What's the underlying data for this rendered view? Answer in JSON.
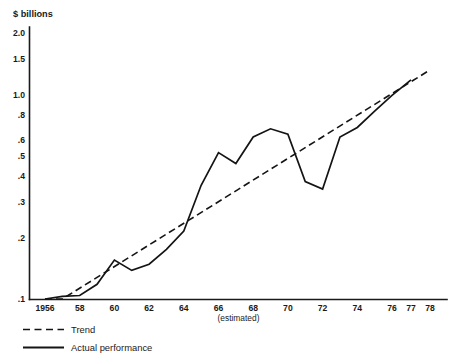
{
  "chart_data": {
    "type": "line",
    "title": "",
    "subtitle": "",
    "unit_label": "$ billions",
    "xlabel": "",
    "ylabel": "",
    "y_scale": "log",
    "ylim": [
      0.1,
      2.0
    ],
    "xlim": [
      1956,
      1978
    ],
    "grid": false,
    "legend_position": "bottom-left",
    "annotation": "(estimated)",
    "annotation_near_year": 1966,
    "y_ticks": [
      {
        "value": 2.0,
        "label": "2.0"
      },
      {
        "value": 1.5,
        "label": "1.5"
      },
      {
        "value": 1.0,
        "label": "1.0"
      },
      {
        "value": 0.8,
        "label": ".8"
      },
      {
        "value": 0.6,
        "label": ".6"
      },
      {
        "value": 0.5,
        "label": ".5"
      },
      {
        "value": 0.4,
        "label": ".4"
      },
      {
        "value": 0.3,
        "label": ".3"
      },
      {
        "value": 0.2,
        "label": ".2"
      },
      {
        "value": 0.1,
        "label": ".1"
      }
    ],
    "x_ticks": [
      {
        "value": 1956,
        "label": "1956"
      },
      {
        "value": 1958,
        "label": "58"
      },
      {
        "value": 1960,
        "label": "60"
      },
      {
        "value": 1962,
        "label": "62"
      },
      {
        "value": 1964,
        "label": "64"
      },
      {
        "value": 1966,
        "label": "66"
      },
      {
        "value": 1968,
        "label": "68"
      },
      {
        "value": 1970,
        "label": "70"
      },
      {
        "value": 1972,
        "label": "72"
      },
      {
        "value": 1974,
        "label": "74"
      },
      {
        "value": 1976,
        "label": "76"
      },
      {
        "value": 1977,
        "label": "77"
      },
      {
        "value": 1978,
        "label": "78"
      }
    ],
    "series": [
      {
        "name": "Actual performance",
        "style": "solid",
        "color": "#141414",
        "x": [
          1956,
          1957,
          1958,
          1959,
          1960,
          1961,
          1962,
          1963,
          1964,
          1965,
          1966,
          1967,
          1968,
          1969,
          1970,
          1971,
          1972,
          1973,
          1974,
          1975,
          1976,
          1977
        ],
        "y": [
          0.1,
          0.103,
          0.104,
          0.118,
          0.155,
          0.138,
          0.148,
          0.175,
          0.215,
          0.36,
          0.52,
          0.46,
          0.62,
          0.68,
          0.64,
          0.375,
          0.345,
          0.62,
          0.69,
          0.83,
          0.99,
          1.18
        ]
      },
      {
        "name": "Trend",
        "style": "dashed",
        "color": "#141414",
        "x": [
          1956,
          1957,
          1978
        ],
        "y": [
          0.1,
          0.1,
          1.32
        ]
      }
    ],
    "legend": [
      {
        "label": "Trend",
        "style": "dashed"
      },
      {
        "label": "Actual performance",
        "style": "solid"
      }
    ]
  }
}
